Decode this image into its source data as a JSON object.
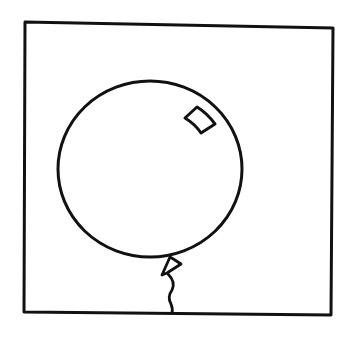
{
  "scene": {
    "description": "Line drawing of a balloon inside a square frame",
    "stroke_color": "#111111",
    "background_color": "#ffffff",
    "elements": [
      {
        "name": "frame",
        "icon": "square-frame"
      },
      {
        "name": "balloon",
        "icon": "balloon-icon"
      },
      {
        "name": "highlight",
        "icon": "highlight-shape"
      },
      {
        "name": "knot",
        "icon": "knot-shape"
      },
      {
        "name": "string",
        "icon": "string-line"
      }
    ]
  }
}
